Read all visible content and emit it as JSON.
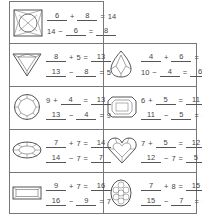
{
  "worksheet": {
    "cells": [
      {
        "gem": "square-cushion-gem",
        "eq1": {
          "a": "6",
          "a_blank": true,
          "op": "+",
          "b": "8",
          "b_blank": true,
          "c": "14",
          "c_blank": false
        },
        "eq2": {
          "a": "14",
          "a_blank": false,
          "op": "−",
          "b": "6",
          "b_blank": true,
          "c": "8",
          "c_blank": true
        }
      },
      {
        "gem": "trillion-gem",
        "eq1": {
          "a": "8",
          "a_blank": true,
          "op": "+",
          "b": "5",
          "b_blank": false,
          "c": "13",
          "c_blank": true
        },
        "eq2": {
          "a": "13",
          "a_blank": true,
          "op": "−",
          "b": "8",
          "b_blank": true,
          "c": "5",
          "c_blank": false
        }
      },
      {
        "gem": "pear-gem",
        "eq1": {
          "a": "4",
          "a_blank": true,
          "op": "+",
          "b": "6",
          "b_blank": true,
          "c": "10",
          "c_blank": false
        },
        "eq2": {
          "a": "10",
          "a_blank": false,
          "op": "−",
          "b": "4",
          "b_blank": true,
          "c": "6",
          "c_blank": true
        }
      },
      {
        "gem": "round-brilliant-gem",
        "eq1": {
          "a": "9",
          "a_blank": false,
          "op": "+",
          "b": "4",
          "b_blank": true,
          "c": "13",
          "c_blank": true
        },
        "eq2": {
          "a": "13",
          "a_blank": true,
          "op": "−",
          "b": "4",
          "b_blank": true,
          "c": "9",
          "c_blank": false
        }
      },
      {
        "gem": "emerald-cut-gem",
        "eq1": {
          "a": "6",
          "a_blank": false,
          "op": "+",
          "b": "5",
          "b_blank": true,
          "c": "11",
          "c_blank": true
        },
        "eq2": {
          "a": "11",
          "a_blank": true,
          "op": "−",
          "b": "5",
          "b_blank": true,
          "c": "6",
          "c_blank": false
        }
      },
      {
        "gem": "oval-gem",
        "eq1": {
          "a": "7",
          "a_blank": true,
          "op": "+",
          "b": "7",
          "b_blank": false,
          "c": "14",
          "c_blank": true
        },
        "eq2": {
          "a": "14",
          "a_blank": true,
          "op": "−",
          "b": "7",
          "b_blank": false,
          "c": "7",
          "c_blank": true
        }
      },
      {
        "gem": "heart-gem",
        "eq1": {
          "a": "7",
          "a_blank": false,
          "op": "+",
          "b": "5",
          "b_blank": true,
          "c": "12",
          "c_blank": true
        },
        "eq2": {
          "a": "12",
          "a_blank": true,
          "op": "−",
          "b": "7",
          "b_blank": false,
          "c": "5",
          "c_blank": true
        }
      },
      {
        "gem": "baguette-gem",
        "eq1": {
          "a": "9",
          "a_blank": true,
          "op": "+",
          "b": "7",
          "b_blank": false,
          "c": "16",
          "c_blank": true
        },
        "eq2": {
          "a": "16",
          "a_blank": true,
          "op": "−",
          "b": "9",
          "b_blank": true,
          "c": "7",
          "c_blank": false
        }
      },
      {
        "gem": "oval-faceted-gem",
        "eq1": {
          "a": "7",
          "a_blank": true,
          "op": "+",
          "b": "8",
          "b_blank": false,
          "c": "15",
          "c_blank": true
        },
        "eq2": {
          "a": "15",
          "a_blank": true,
          "op": "−",
          "b": "7",
          "b_blank": true,
          "c": "8",
          "c_blank": false
        }
      }
    ],
    "equals": "="
  }
}
